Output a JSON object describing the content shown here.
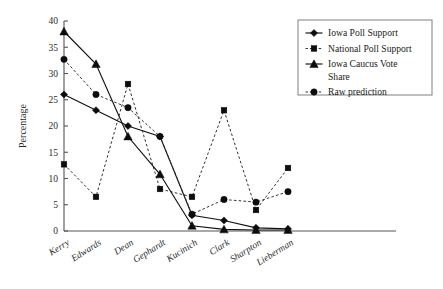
{
  "chart_data": {
    "type": "line",
    "title": "",
    "xlabel": "",
    "ylabel": "Percentage",
    "ylim": [
      0,
      40
    ],
    "ytick_step": 5,
    "yticks": [
      0,
      5,
      10,
      15,
      20,
      25,
      30,
      35,
      40
    ],
    "grid": false,
    "legend_position": "top-right",
    "categories": [
      "Kerry",
      "Edwards",
      "Dean",
      "Gephardt",
      "Kucinich",
      "Clark",
      "Sharpton",
      "Lieberman"
    ],
    "series": [
      {
        "name": "Iowa Poll Support",
        "marker": "diamond",
        "line_style": "solid",
        "color": "#111111",
        "values": [
          26.0,
          23.0,
          20.0,
          18.0,
          3.0,
          2.0,
          0.6,
          0.4
        ]
      },
      {
        "name": "National Poll Support",
        "marker": "square",
        "line_style": "dashed",
        "color": "#333333",
        "values": [
          12.7,
          6.5,
          28.0,
          8.0,
          6.5,
          23.0,
          4.0,
          12.0
        ]
      },
      {
        "name": "Iowa Caucus Vote Share",
        "marker": "triangle",
        "line_style": "solid",
        "color": "#111111",
        "values": [
          38.0,
          31.8,
          18.0,
          10.8,
          1.0,
          0.3,
          0.2,
          0.2
        ]
      },
      {
        "name": "Raw prediction",
        "marker": "circle",
        "line_style": "dashed",
        "color": "#333333",
        "values": [
          32.7,
          26.0,
          23.5,
          18.0,
          3.2,
          6.0,
          5.5,
          7.5
        ]
      }
    ]
  },
  "legend": {
    "items": [
      {
        "label": "Iowa Poll Support"
      },
      {
        "label": "National Poll Support"
      },
      {
        "label": "Iowa Caucus Vote"
      },
      {
        "label": "Share"
      },
      {
        "label": "Raw prediction"
      }
    ]
  }
}
